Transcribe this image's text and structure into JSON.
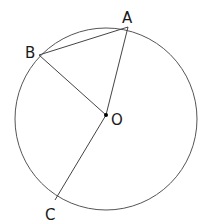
{
  "diagram": {
    "type": "circle-geometry",
    "circle": {
      "cx": 106,
      "cy": 119,
      "r": 91,
      "stroke": "#555555"
    },
    "points": {
      "A": {
        "label": "A",
        "x": 128,
        "y": 27,
        "label_x": 122,
        "label_y": 23
      },
      "B": {
        "label": "B",
        "x": 39,
        "y": 55,
        "label_x": 25,
        "label_y": 58
      },
      "C": {
        "label": "C",
        "x": 55,
        "y": 200,
        "label_x": 45,
        "label_y": 220
      },
      "O": {
        "label": "O",
        "x": 106,
        "y": 115,
        "label_x": 111,
        "label_y": 125
      }
    },
    "segments": [
      {
        "from": "B",
        "to": "A",
        "name": "chord-BA"
      },
      {
        "from": "O",
        "to": "A",
        "name": "radius-OA"
      },
      {
        "from": "O",
        "to": "B",
        "name": "radius-OB"
      },
      {
        "from": "O",
        "to": "C",
        "name": "radius-OC"
      }
    ],
    "line_color": "#444444",
    "dot_color": "#000000"
  }
}
